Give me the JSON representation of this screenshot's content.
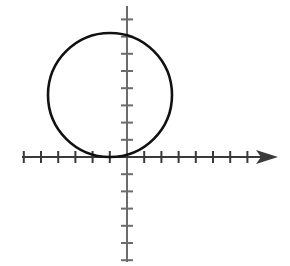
{
  "figure": {
    "title": "",
    "background_color": "#ffffff",
    "width": 290,
    "height": 266
  },
  "chart_data": {
    "type": "scatter",
    "title": "",
    "subtitle": "",
    "xlabel": "",
    "ylabel": "",
    "grid": false,
    "legend": null,
    "axes": {
      "origin_px": [
        127,
        157
      ],
      "tick_spacing_px": 17.2,
      "x_axis": {
        "line_color": "#3a3a3a",
        "line_width_px": 2,
        "start_px": 22,
        "end_px": 278,
        "arrow": "right",
        "arrow_tip_px": 278,
        "ticks_left_of_origin": 6,
        "ticks_right_of_origin": 8,
        "tick_half_length_px": 6,
        "xlim": [
          -6.1,
          8.8
        ],
        "tick_labels": []
      },
      "y_axis": {
        "line_color": "#6b6b6b",
        "line_width_px": 2,
        "start_px": 6,
        "end_px": 262,
        "arrow": "none",
        "ticks_above_origin": 8,
        "ticks_below_origin": 6,
        "tick_half_length_px": 6,
        "ylim": [
          -6.1,
          8.8
        ],
        "tick_labels": []
      }
    },
    "shapes": [
      {
        "kind": "circle",
        "label": "circle tangent to x-axis at origin",
        "center_px": [
          110,
          95
        ],
        "radius_px": 62,
        "center_units": [
          -1.0,
          3.6
        ],
        "radius_units": 3.6,
        "stroke": "#111111",
        "stroke_width_px": 2.6,
        "fill": "none",
        "tangent_point_units": [
          -1.0,
          0.0
        ],
        "bounds_px": {
          "left": 48,
          "right": 172,
          "top": 33,
          "bottom": 157
        }
      }
    ],
    "annotations": [],
    "series": []
  },
  "colors": {
    "curve": "#111111",
    "x_axis": "#3a3a3a",
    "y_axis": "#6b6b6b",
    "background": "#ffffff"
  }
}
